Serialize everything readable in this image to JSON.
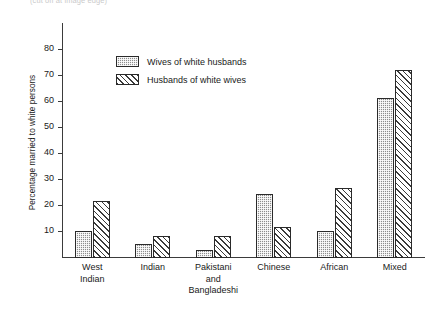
{
  "top_caption": "(cut off at image edge)",
  "chart_data": {
    "type": "bar",
    "title": "",
    "xlabel": "",
    "ylabel": "Percentage married to white persons",
    "ylim": [
      0,
      80
    ],
    "yticks": [
      10,
      20,
      30,
      40,
      50,
      60,
      70,
      80
    ],
    "grid": false,
    "legend_position": "top-left-inside",
    "categories": [
      "West\nIndian",
      "Indian",
      "Pakistani\nand\nBangladeshi",
      "Chinese",
      "African",
      "Mixed"
    ],
    "series": [
      {
        "name": "Wives of white husbands",
        "fill": "stipple",
        "values": [
          10.5,
          5.5,
          3.0,
          24.5,
          10.5,
          61.5
        ]
      },
      {
        "name": "Husbands of white wives",
        "fill": "diagonal-hatch",
        "values": [
          22.0,
          8.5,
          8.5,
          12.0,
          27.0,
          72.5
        ]
      }
    ]
  },
  "colors": {
    "axis": "#3b3b3b",
    "series_0": "#8e8e8e",
    "series_1": "#ffffff",
    "hatch": "#3a3a3a",
    "background": "#ffffff"
  }
}
